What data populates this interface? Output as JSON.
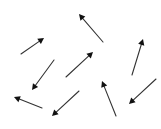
{
  "diagram": {
    "type": "vector-field",
    "background": "#ffffff",
    "arrow_color": "#333333",
    "head_color": "#111111",
    "stroke_width": 1.1,
    "arrows": [
      {
        "id": 1,
        "direction": "up-right",
        "tail": [
          21,
          54
        ],
        "head": [
          44,
          38
        ]
      },
      {
        "id": 2,
        "direction": "up-left",
        "tail": [
          103,
          42
        ],
        "head": [
          79,
          14
        ]
      },
      {
        "id": 3,
        "direction": "down-left",
        "tail": [
          54,
          60
        ],
        "head": [
          32,
          90
        ]
      },
      {
        "id": 4,
        "direction": "up-right",
        "tail": [
          66,
          77
        ],
        "head": [
          93,
          52
        ]
      },
      {
        "id": 5,
        "direction": "up",
        "tail": [
          132,
          75
        ],
        "head": [
          143,
          39
        ]
      },
      {
        "id": 6,
        "direction": "down-left",
        "tail": [
          156,
          79
        ],
        "head": [
          129,
          104
        ]
      },
      {
        "id": 7,
        "direction": "left",
        "tail": [
          42,
          108
        ],
        "head": [
          14,
          97
        ]
      },
      {
        "id": 8,
        "direction": "down-left",
        "tail": [
          79,
          91
        ],
        "head": [
          52,
          116
        ]
      },
      {
        "id": 9,
        "direction": "up",
        "tail": [
          116,
          116
        ],
        "head": [
          102,
          81
        ]
      }
    ]
  }
}
